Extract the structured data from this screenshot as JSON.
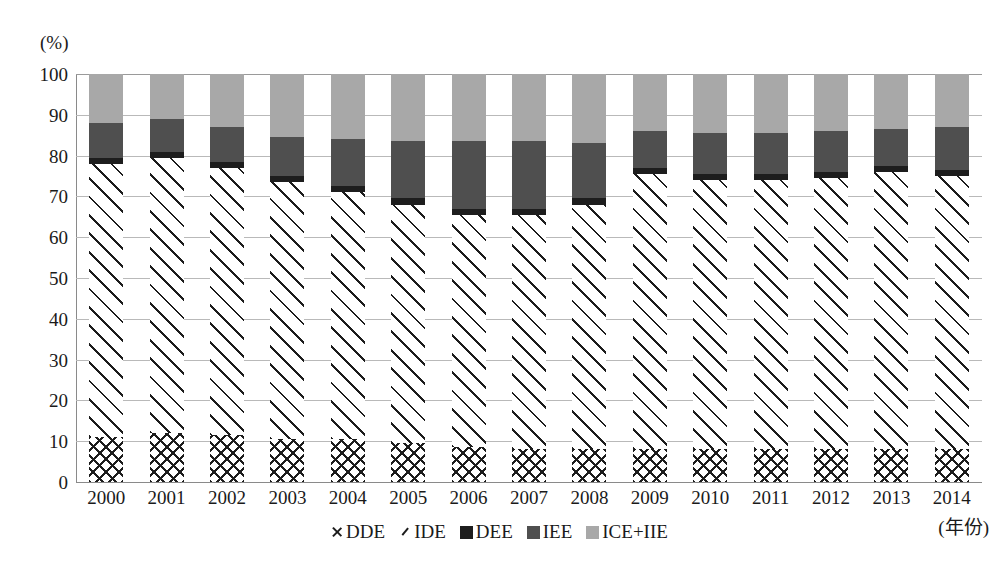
{
  "axes": {
    "y_unit_label": "(%)",
    "y_ticks": [
      "100",
      "90",
      "80",
      "70",
      "60",
      "50",
      "40",
      "30",
      "20",
      "10",
      "0"
    ],
    "x_axis_title": "(年份)"
  },
  "legend": {
    "position": "bottom-center",
    "items": [
      {
        "label": "DDE",
        "marker": "x-marker-icon",
        "color": "#1c1c1c"
      },
      {
        "label": "IDE",
        "marker": "slash-marker-icon",
        "color": "#1c1c1c"
      },
      {
        "label": "DEE",
        "marker": "square-swatch-icon",
        "color": "#1d1d1d"
      },
      {
        "label": "IEE",
        "marker": "square-swatch-icon",
        "color": "#4f4f4f"
      },
      {
        "label": "ICE+IIE",
        "marker": "square-swatch-icon",
        "color": "#a8a8a8"
      }
    ]
  },
  "chart_data": {
    "type": "bar",
    "stacked": true,
    "title": "",
    "xlabel": "(年份)",
    "ylabel": "(%)",
    "ylim": [
      0,
      100
    ],
    "ytick_step": 10,
    "grid": true,
    "legend_position": "bottom-center",
    "categories": [
      "2000",
      "2001",
      "2002",
      "2003",
      "2004",
      "2005",
      "2006",
      "2007",
      "2008",
      "2009",
      "2010",
      "2011",
      "2012",
      "2013",
      "2014"
    ],
    "series": [
      {
        "name": "DDE",
        "pattern": "cross-hatch",
        "color": "#1c1c1c",
        "values": [
          11.0,
          12.0,
          11.5,
          10.5,
          10.5,
          9.5,
          8.5,
          8.0,
          8.0,
          8.0,
          8.0,
          8.0,
          8.0,
          8.0,
          8.0
        ]
      },
      {
        "name": "IDE",
        "pattern": "diagonal-hatch",
        "color": "#1c1c1c",
        "values": [
          67.0,
          67.5,
          65.5,
          63.0,
          60.5,
          58.5,
          57.0,
          57.5,
          60.0,
          67.5,
          66.0,
          66.0,
          66.5,
          68.0,
          67.0
        ]
      },
      {
        "name": "DEE",
        "pattern": "solid",
        "color": "#1d1d1d",
        "values": [
          1.5,
          1.5,
          1.5,
          1.5,
          1.5,
          1.5,
          1.5,
          1.5,
          1.5,
          1.5,
          1.5,
          1.5,
          1.5,
          1.5,
          1.5
        ]
      },
      {
        "name": "IEE",
        "pattern": "solid",
        "color": "#4f4f4f",
        "values": [
          8.5,
          8.0,
          8.5,
          9.5,
          11.5,
          14.0,
          16.5,
          16.5,
          13.5,
          9.0,
          10.0,
          10.0,
          10.0,
          9.0,
          10.5
        ]
      },
      {
        "name": "ICE+IIE",
        "pattern": "solid",
        "color": "#a8a8a8",
        "values": [
          12.0,
          11.0,
          13.0,
          15.5,
          16.0,
          16.5,
          16.5,
          16.5,
          17.0,
          14.0,
          14.5,
          14.5,
          14.0,
          13.5,
          13.0
        ]
      }
    ],
    "stack_tops": {
      "DDE": [
        11.0,
        12.0,
        11.5,
        10.5,
        10.5,
        9.5,
        8.5,
        8.0,
        8.0,
        8.0,
        8.0,
        8.0,
        8.0,
        8.0,
        8.0
      ],
      "IDE": [
        78.0,
        79.5,
        77.0,
        73.5,
        71.0,
        68.0,
        65.5,
        65.5,
        68.0,
        75.5,
        74.0,
        74.0,
        74.5,
        76.0,
        75.0
      ],
      "DEE": [
        79.5,
        81.0,
        78.5,
        75.0,
        72.5,
        69.5,
        67.0,
        67.0,
        69.5,
        77.0,
        75.5,
        75.5,
        76.0,
        77.5,
        76.5
      ],
      "IEE": [
        88.0,
        89.0,
        87.0,
        84.5,
        84.0,
        83.5,
        83.5,
        83.5,
        83.0,
        86.0,
        85.5,
        85.5,
        86.0,
        86.5,
        87.0
      ],
      "ICE+IIE": [
        100,
        100,
        100,
        100,
        100,
        100,
        100,
        100,
        100,
        100,
        100,
        100,
        100,
        100,
        100
      ]
    }
  }
}
